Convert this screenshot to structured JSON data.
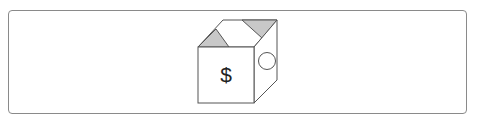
{
  "diagram": {
    "front_symbol": "$",
    "colors": {
      "stroke": "#555555",
      "flap_fill": "#c8c8c8",
      "face_fill": "#ffffff",
      "frame_border": "#8a8a8a"
    }
  }
}
